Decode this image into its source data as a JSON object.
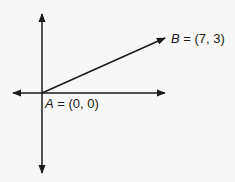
{
  "diagram": {
    "type": "coordinate-vector",
    "axes": {
      "horizontal": "x-axis",
      "vertical": "y-axis",
      "arrows_both_ends": true
    },
    "points": [
      {
        "name": "A",
        "coords_label": "(0, 0)",
        "x": 0,
        "y": 0
      },
      {
        "name": "B",
        "coords_label": "(7, 3)",
        "x": 7,
        "y": 3
      }
    ],
    "vector": {
      "from": "A",
      "to": "B"
    },
    "labels": {
      "a_name": "A",
      "a_eq": " = (0, 0)",
      "b_name": "B",
      "b_eq": " = (7, 3)"
    },
    "colors": {
      "line": "#1a1a1a",
      "background": "#f7f7f7"
    }
  }
}
